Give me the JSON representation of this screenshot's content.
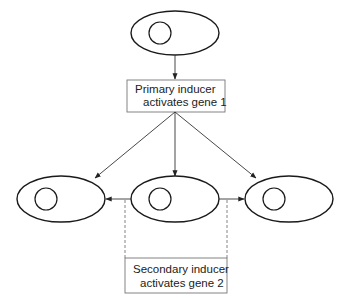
{
  "diagram": {
    "primary_box": {
      "line1": "Primary inducer",
      "line2": "activates gene 1"
    },
    "secondary_box": {
      "line1": "Secondary inducer",
      "line2": "activates gene 2"
    },
    "cells": [
      {
        "id": "top-cell"
      },
      {
        "id": "left-cell"
      },
      {
        "id": "middle-cell"
      },
      {
        "id": "right-cell"
      }
    ],
    "colors": {
      "stroke": "#1a1a1a",
      "box_stroke": "#777777",
      "background": "#ffffff"
    }
  }
}
